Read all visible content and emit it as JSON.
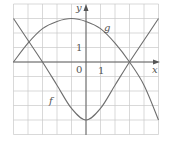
{
  "chart_data": {
    "type": "line",
    "title": "",
    "xlabel": "x",
    "ylabel": "y",
    "xlim": [
      -5,
      5
    ],
    "ylim": [
      -5,
      4
    ],
    "grid": true,
    "origin_label": "0",
    "tick_labels": {
      "x_one": "1",
      "y_one": "1"
    },
    "series": [
      {
        "name": "f",
        "label": "f",
        "x": [
          -5,
          -4,
          -3,
          -2,
          -1,
          0,
          1,
          2,
          3,
          4,
          5
        ],
        "values": [
          3.0,
          1.5,
          0.0,
          -1.6,
          -3.2,
          -4.0,
          -3.2,
          -1.6,
          0.0,
          1.5,
          3.0
        ]
      },
      {
        "name": "g",
        "label": "g",
        "x": [
          -5,
          -4,
          -3,
          -2,
          -1,
          0,
          1,
          2,
          3,
          4,
          5
        ],
        "values": [
          0.0,
          1.3,
          2.3,
          2.8,
          3.0,
          2.8,
          2.3,
          1.3,
          0.0,
          -1.6,
          -4.0
        ]
      }
    ]
  },
  "colors": {
    "grid": "#c8c8c8",
    "axis": "#555555",
    "curve": "#6e6e6e"
  }
}
